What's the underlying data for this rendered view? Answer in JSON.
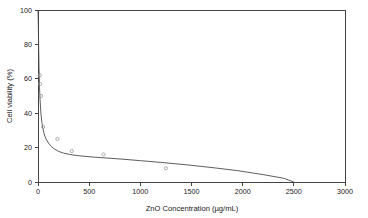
{
  "chart_data": {
    "type": "line",
    "title": "",
    "xlabel": "ZnO Concentration (µg/mL)",
    "ylabel": "Cell viability (%)",
    "xlim": [
      0,
      3000
    ],
    "ylim": [
      0,
      100
    ],
    "grid": false,
    "legend": "none",
    "xticks": [
      0,
      500,
      1000,
      1500,
      2000,
      2500,
      3000
    ],
    "xtick_labels": [
      "0",
      "500",
      "1000",
      "1500",
      "2000",
      "2500",
      "3000"
    ],
    "yticks": [
      0,
      20,
      40,
      60,
      80,
      100
    ],
    "ytick_labels": [
      "0",
      "20",
      "40",
      "60",
      "80",
      "100"
    ],
    "series": [
      {
        "name": "fitted curve",
        "style": "line",
        "x": [
          0,
          3,
          6,
          10,
          15,
          20,
          25,
          30,
          35,
          40,
          50,
          60,
          75,
          90,
          110,
          130,
          160,
          200,
          250,
          310,
          380,
          460,
          560,
          680,
          820,
          1000,
          1200,
          1450,
          1700,
          1950,
          2200,
          2400,
          2500
        ],
        "y": [
          100,
          92,
          80,
          66,
          55,
          48,
          43,
          39,
          36,
          34,
          30.5,
          28,
          25.5,
          23.8,
          22,
          20.7,
          19.2,
          17.8,
          16.8,
          16.0,
          15.4,
          14.9,
          14.4,
          13.9,
          13.3,
          12.4,
          11.4,
          10.0,
          8.4,
          6.6,
          4.3,
          2.2,
          0
        ]
      },
      {
        "name": "measured viability",
        "style": "scatter",
        "x": [
          18,
          22,
          30,
          50,
          190,
          330,
          640,
          1250
        ],
        "y": [
          62,
          57,
          50,
          32,
          25,
          18,
          16,
          8
        ]
      }
    ]
  }
}
